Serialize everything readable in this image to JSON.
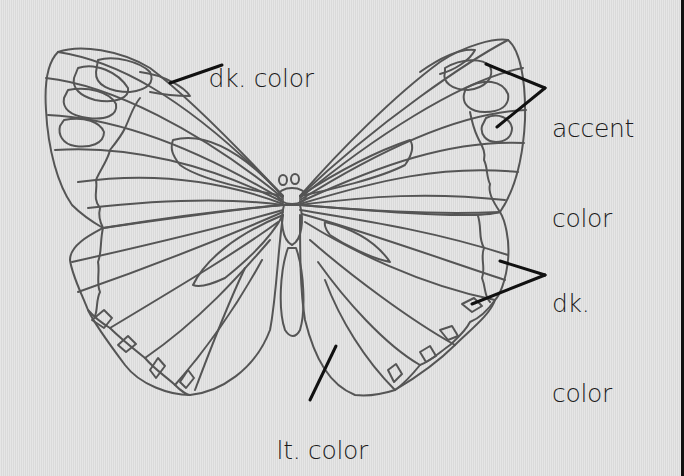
{
  "figure": {
    "background_color": "#e1e1e1",
    "line_color": "#555555",
    "leader_color": "#111111"
  },
  "labels": {
    "forewing_edge": {
      "text": "dk. color"
    },
    "accent": {
      "line1": "accent",
      "line2": "color"
    },
    "hindwing_edge": {
      "line1": "dk.",
      "line2": "color"
    },
    "hindwing_inner": {
      "text": "lt. color"
    }
  }
}
